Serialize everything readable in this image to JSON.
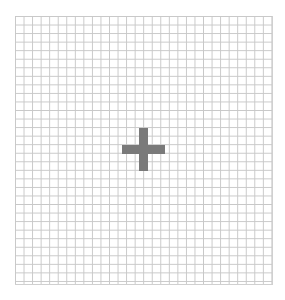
{
  "canvas": {
    "type": "grid",
    "columns": 30,
    "rows": 31,
    "cell_size_px": 8.5,
    "line_color": "#c8c8c8",
    "background": "#ffffff"
  },
  "cursor": {
    "icon": "crosshair-plus-icon",
    "color": "#7a7a7a",
    "center": {
      "x": 143,
      "y": 149
    }
  }
}
